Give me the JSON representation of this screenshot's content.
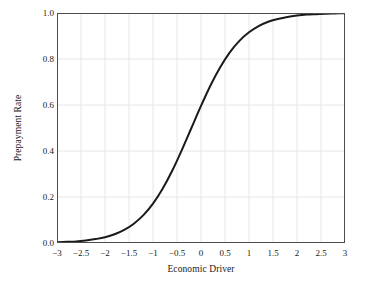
{
  "chart_data": {
    "type": "line",
    "title": "",
    "xlabel": "Economic Driver",
    "ylabel": "Prepayment Rate",
    "xlim": [
      -3,
      3
    ],
    "ylim": [
      0.0,
      1.0
    ],
    "grid": true,
    "legend": false,
    "legend_position": "none",
    "line_color": "#1a1a1a",
    "grid_color": "#e6e6e6",
    "frame_color": "#4d4d4d",
    "xtick_labels": [
      "−3",
      "−2.5",
      "−2",
      "−1.5",
      "−1",
      "−0.5",
      "0",
      "0.5",
      "1",
      "1.5",
      "2",
      "2.5",
      "3"
    ],
    "xtick_values": [
      -3,
      -2.5,
      -2,
      -1.5,
      -1,
      -0.5,
      0,
      0.5,
      1,
      1.5,
      2,
      2.5,
      3
    ],
    "ytick_labels": [
      "0.0",
      "0.2",
      "0.4",
      "0.6",
      "0.8",
      "1.0"
    ],
    "ytick_values": [
      0.0,
      0.2,
      0.4,
      0.6,
      0.8,
      1.0
    ],
    "series": [
      {
        "name": "Prepayment Rate",
        "x": [
          -3.0,
          -2.8,
          -2.6,
          -2.4,
          -2.2,
          -2.0,
          -1.8,
          -1.6,
          -1.4,
          -1.2,
          -1.0,
          -0.8,
          -0.6,
          -0.4,
          -0.2,
          0.0,
          0.2,
          0.4,
          0.6,
          0.8,
          1.0,
          1.2,
          1.4,
          1.6,
          1.8,
          2.0,
          2.2,
          2.4,
          2.6,
          2.8,
          3.0
        ],
        "values": [
          0.003,
          0.005,
          0.007,
          0.011,
          0.017,
          0.025,
          0.038,
          0.057,
          0.084,
          0.121,
          0.171,
          0.236,
          0.314,
          0.404,
          0.5,
          0.596,
          0.686,
          0.764,
          0.829,
          0.879,
          0.916,
          0.943,
          0.962,
          0.974,
          0.983,
          0.989,
          0.993,
          0.995,
          0.997,
          0.998,
          0.999
        ]
      }
    ]
  },
  "axes": {
    "ylabel": "Prepayment Rate",
    "xlabel": "Economic Driver"
  }
}
